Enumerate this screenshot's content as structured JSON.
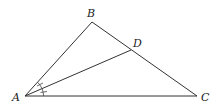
{
  "diagram": {
    "type": "triangle-with-angle-bisector",
    "points": {
      "A": {
        "label": "A",
        "x": 25,
        "y": 96
      },
      "B": {
        "label": "B",
        "x": 92,
        "y": 22
      },
      "C": {
        "label": "C",
        "x": 197,
        "y": 96
      },
      "D": {
        "label": "D",
        "x": 131,
        "y": 50
      }
    },
    "segments": [
      "AB",
      "BC",
      "CA",
      "AD"
    ],
    "annotations": [
      "angle BAD marked equal to angle DAC (single tick arcs)"
    ]
  },
  "labels": {
    "A": "A",
    "B": "B",
    "C": "C",
    "D": "D"
  }
}
